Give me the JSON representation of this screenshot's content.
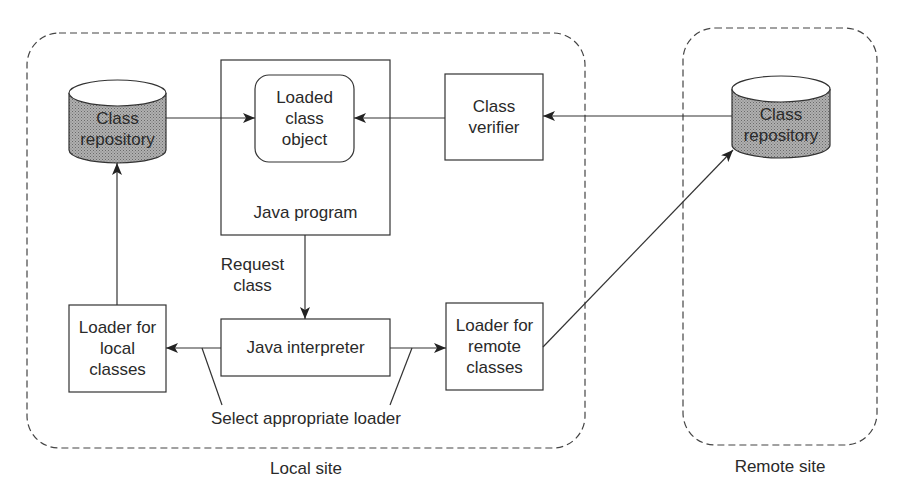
{
  "diagram": {
    "colors": {
      "stroke": "#333333",
      "cylinder_fill": "#9a9a9a",
      "background": "#ffffff"
    },
    "regions": {
      "local_site": {
        "label": "Local site"
      },
      "remote_site": {
        "label": "Remote site"
      }
    },
    "nodes": {
      "local_repository": {
        "line1": "Class",
        "line2": "repository",
        "shape": "cylinder"
      },
      "remote_repository": {
        "line1": "Class",
        "line2": "repository",
        "shape": "cylinder"
      },
      "loaded_class_object": {
        "line1": "Loaded",
        "line2": "class",
        "line3": "object",
        "shape": "rounded-rect"
      },
      "java_program": {
        "label": "Java program",
        "shape": "rect"
      },
      "class_verifier": {
        "line1": "Class",
        "line2": "verifier",
        "shape": "rect"
      },
      "loader_local": {
        "line1": "Loader for",
        "line2": "local",
        "line3": "classes",
        "shape": "rect"
      },
      "java_interpreter": {
        "label": "Java interpreter",
        "shape": "rect"
      },
      "loader_remote": {
        "line1": "Loader for",
        "line2": "remote",
        "line3": "classes",
        "shape": "rect"
      }
    },
    "annotations": {
      "request_class": {
        "line1": "Request",
        "line2": "class"
      },
      "select_loader": {
        "label": "Select appropriate loader"
      }
    },
    "edges": [
      {
        "from": "local_repository",
        "to": "loaded_class_object"
      },
      {
        "from": "class_verifier",
        "to": "loaded_class_object"
      },
      {
        "from": "remote_repository",
        "to": "class_verifier"
      },
      {
        "from": "java_program",
        "to": "java_interpreter",
        "label": "Request class"
      },
      {
        "from": "java_interpreter",
        "to": "loader_local"
      },
      {
        "from": "java_interpreter",
        "to": "loader_remote"
      },
      {
        "from": "loader_local",
        "to": "local_repository"
      },
      {
        "from": "loader_remote",
        "to": "remote_repository"
      }
    ]
  }
}
